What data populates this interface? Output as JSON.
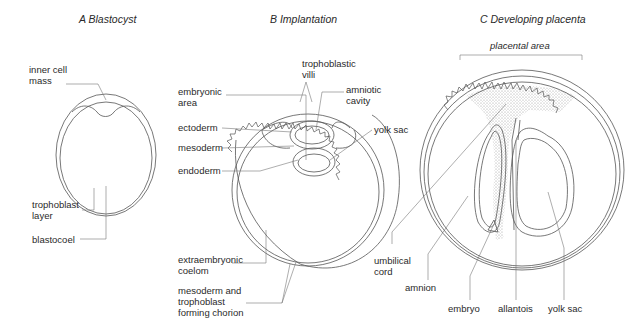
{
  "panels": [
    {
      "title": "A  Blastocyst",
      "labels": {
        "inner_cell_mass": "inner cell\nmass",
        "trophoblast_layer": "trophoblast\nlayer",
        "blastocoel": "blastocoel"
      }
    },
    {
      "title": "B  Implantation",
      "labels": {
        "trophoblastic_villi": "trophoblastic\nvilli",
        "embryonic_area": "embryonic\narea",
        "amniotic_cavity": "amniotic\ncavity",
        "ectoderm": "ectoderm",
        "yolk_sac": "yolk sac",
        "mesoderm": "mesoderm",
        "endoderm": "endoderm",
        "extraembryonic_coelom": "extraembryonic\ncoelom",
        "chorion": "mesoderm and\ntrophoblast\nforming chorion"
      }
    },
    {
      "title": "C  Developing placenta",
      "labels": {
        "placental_area": "placental area",
        "umbilical_cord": "umbilical\ncord",
        "amnion": "amnion",
        "embryo": "embryo",
        "allantois": "allantois",
        "yolk_sac": "yolk sac"
      }
    }
  ],
  "colors": {
    "line": "#555555",
    "stipple": "#d9d9d9",
    "text": "#2a2a2a"
  }
}
